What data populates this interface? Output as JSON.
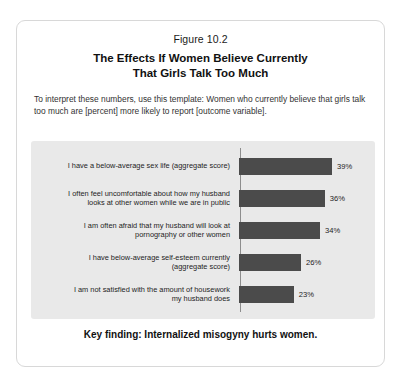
{
  "figure": {
    "number": "Figure 10.2",
    "title_line1": "The Effects If Women Believe Currently",
    "title_line2": "That Girls Talk Too Much",
    "intro": "To interpret these numbers, use this template: Women who currently believe that girls talk too much are [percent] more likely to report [outcome variable].",
    "key_finding": "Key finding: Internalized misogyny hurts women."
  },
  "colors": {
    "bar": "#4b4b4b",
    "panel_background": "#e9e9e9",
    "axis": "#8d8d8d",
    "card_border": "#d8d8d8"
  },
  "chart_data": {
    "type": "bar",
    "orientation": "horizontal",
    "title": "The Effects If Women Believe Currently That Girls Talk Too Much",
    "subtitle": "Figure 10.2",
    "xlabel": "",
    "ylabel": "",
    "xlim": [
      0,
      39
    ],
    "grid": false,
    "legend": "none",
    "categories": [
      "I have a below-average sex life (aggregate score)",
      "I often feel uncomfortable about how my husband looks at other women while we are in public",
      "I am often afraid that my husband will look at pornography or other women",
      "I have below-average self-esteem currently (aggregate score)",
      "I am not satisfied with the amount of housework my husband does"
    ],
    "values": [
      39,
      36,
      34,
      26,
      23
    ],
    "value_labels": [
      "39%",
      "36%",
      "34%",
      "26%",
      "23%"
    ],
    "category_lines": [
      [
        "I have a below-average sex life (aggregate score)"
      ],
      [
        "I often feel uncomfortable about how my husband",
        "looks at other women while we are in public"
      ],
      [
        "I am often afraid that my husband will look at",
        "pornography or other women"
      ],
      [
        "I have below-average self-esteem currently",
        "(aggregate score)"
      ],
      [
        "I am not satisfied with the amount of housework",
        "my husband does"
      ]
    ]
  }
}
